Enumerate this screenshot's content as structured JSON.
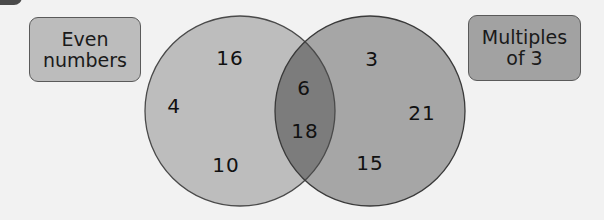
{
  "diagram": {
    "type": "venn",
    "sets": [
      {
        "label": "Even numbers",
        "label_lines": [
          "Even",
          "numbers"
        ],
        "fill": "#bdbdbd"
      },
      {
        "label": "Multiples of 3",
        "label_lines": [
          "Multiples",
          "of 3"
        ],
        "fill": "#a6a6a6"
      }
    ],
    "overlap_fill": "#7c7c7c",
    "regions": {
      "even_only": [
        "16",
        "4",
        "10"
      ],
      "both": [
        "6",
        "18"
      ],
      "multiples_of_3_only": [
        "3",
        "21",
        "15"
      ]
    }
  },
  "labels": {
    "left_line1": "Even",
    "left_line2": "numbers",
    "right_line1": "Multiples",
    "right_line2": "of 3"
  },
  "numbers": {
    "n16": "16",
    "n4": "4",
    "n10": "10",
    "n6": "6",
    "n18": "18",
    "n3": "3",
    "n21": "21",
    "n15": "15"
  }
}
